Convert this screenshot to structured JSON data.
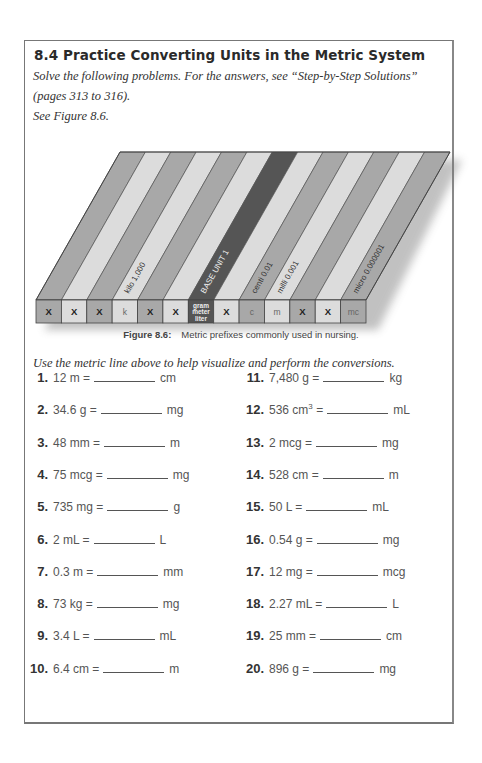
{
  "section": {
    "title": "8.4 Practice Converting Units in the Metric System",
    "intro_lines": [
      "Solve the following problems. For the answers, see “Step-by-Step Solutions”",
      "(pages 313 to 316).",
      "See Figure 8.6."
    ]
  },
  "figure": {
    "label": "Figure 8.6:",
    "caption": "Metric prefixes commonly used in nursing.",
    "stripe_labels": {
      "kilo": "kilo  1,000",
      "base": "BASE UNIT 1",
      "centi": "centi  0.01",
      "milli": "milli  0.001",
      "micro": "micro  0.000001"
    },
    "boxes": [
      {
        "label": "X",
        "color": "#a8a8a8",
        "bold": true
      },
      {
        "label": "X",
        "color": "#dcdcdc",
        "bold": true
      },
      {
        "label": "X",
        "color": "#a8a8a8",
        "bold": true
      },
      {
        "label": "k",
        "color": "#dcdcdc",
        "bold": false
      },
      {
        "label": "X",
        "color": "#a8a8a8",
        "bold": true
      },
      {
        "label": "X",
        "color": "#dcdcdc",
        "bold": true
      },
      {
        "label": "gram\nmeter\nliter",
        "color": "#555555",
        "bold": true
      },
      {
        "label": "X",
        "color": "#dcdcdc",
        "bold": true
      },
      {
        "label": "c",
        "color": "#a8a8a8",
        "bold": false
      },
      {
        "label": "m",
        "color": "#dcdcdc",
        "bold": false
      },
      {
        "label": "X",
        "color": "#a8a8a8",
        "bold": true
      },
      {
        "label": "X",
        "color": "#dcdcdc",
        "bold": true
      },
      {
        "label": "mc",
        "color": "#a8a8a8",
        "bold": false
      }
    ],
    "base_line1": "gram",
    "base_line2": "meter",
    "base_line3": "liter"
  },
  "instructions": "Use the metric line above to help visualize and perform the conversions.",
  "problems_left": [
    {
      "num": "1.",
      "given": "12 m =",
      "unit": "cm"
    },
    {
      "num": "2.",
      "given": "34.6 g =",
      "unit": "mg"
    },
    {
      "num": "3.",
      "given": "48 mm =",
      "unit": "m"
    },
    {
      "num": "4.",
      "given": "75 mcg =",
      "unit": "mg"
    },
    {
      "num": "5.",
      "given": "735 mg =",
      "unit": "g"
    },
    {
      "num": "6.",
      "given": "2 mL =",
      "unit": "L"
    },
    {
      "num": "7.",
      "given": "0.3 m =",
      "unit": "mm"
    },
    {
      "num": "8.",
      "given": "73 kg =",
      "unit": "mg"
    },
    {
      "num": "9.",
      "given": "3.4 L =",
      "unit": "mL"
    },
    {
      "num": "10.",
      "given": "6.4 cm =",
      "unit": "m"
    }
  ],
  "problems_right": [
    {
      "num": "11.",
      "given": "7,480 g =",
      "unit": "kg"
    },
    {
      "num": "12.",
      "given": "536 cm",
      "given_sup": "3",
      "given_after": " =",
      "unit": "mL"
    },
    {
      "num": "13.",
      "given": "2 mcg =",
      "unit": "mg"
    },
    {
      "num": "14.",
      "given": "528 cm =",
      "unit": "m"
    },
    {
      "num": "15.",
      "given": "50 L =",
      "unit": "mL"
    },
    {
      "num": "16.",
      "given": "0.54 g =",
      "unit": "mg"
    },
    {
      "num": "17.",
      "given": "12 mg =",
      "unit": "mcg"
    },
    {
      "num": "18.",
      "given": "2.27 mL =",
      "unit": "L"
    },
    {
      "num": "19.",
      "given": "25 mm =",
      "unit": "cm"
    },
    {
      "num": "20.",
      "given": "896 g =",
      "unit": "mg"
    }
  ]
}
